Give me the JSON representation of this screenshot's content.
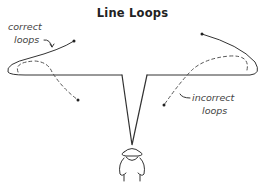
{
  "title": "Line Loops",
  "labels": {
    "correct": [
      "correct",
      "loops"
    ],
    "incorrect": [
      "incorrect",
      "loops"
    ]
  },
  "figure": {
    "colors": {
      "line": "#333333",
      "dashed": "#555555",
      "text": "#222222"
    }
  }
}
